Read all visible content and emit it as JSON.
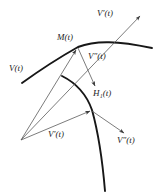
{
  "figure": {
    "width": 155,
    "height": 192,
    "background_color": "#ffffff",
    "stroke_color": "#1c1c1c",
    "thin_stroke_color": "#5a5a5a"
  },
  "labels": {
    "v_prime_top": {
      "base": "V",
      "prime": "′",
      "arg": "(t)",
      "text": "V′(t)"
    },
    "m_t": {
      "base": "M",
      "arg": "(t)",
      "text": "M(t)"
    },
    "v_double_prime_mid": {
      "base": "V",
      "prime": "″",
      "arg": "(t)",
      "text": "V″(t)"
    },
    "v_t_left": {
      "base": "V",
      "prime": "",
      "arg": "(t)",
      "text": "V(t)"
    },
    "h1_t": {
      "base": "H",
      "sub": "1",
      "arg": "(t)",
      "text": "H₁(t)"
    },
    "v_prime_bottom": {
      "base": "V",
      "prime": "′",
      "arg": "(t)",
      "text": "V′(t)"
    },
    "v_double_prime_bottom": {
      "base": "V",
      "prime": "″",
      "arg": "(t)",
      "text": "V″(t)"
    }
  },
  "geometry": {
    "point_M": [
      78,
      47
    ],
    "point_H1": [
      92,
      110
    ],
    "point_origin": [
      21,
      140
    ],
    "upper_curve": "thick curve peaking at M(t), descending right to edge",
    "lower_curve": "thick curve from (62,76) through H1(t) descending steeply to bottom",
    "vectors": [
      {
        "name": "V-prime-top",
        "from": [
          21,
          140
        ],
        "to": [
          145,
          12
        ]
      },
      {
        "name": "V-t-left",
        "from": [
          21,
          140
        ],
        "to": [
          78,
          47
        ]
      },
      {
        "name": "V-double-prime-mid",
        "from": [
          78,
          47
        ],
        "to": [
          96,
          88
        ]
      },
      {
        "name": "V-prime-bottom",
        "from": [
          21,
          140
        ],
        "to": [
          92,
          110
        ]
      },
      {
        "name": "V-double-prime-bottom",
        "from": [
          92,
          110
        ],
        "to": [
          126,
          134
        ]
      }
    ]
  }
}
